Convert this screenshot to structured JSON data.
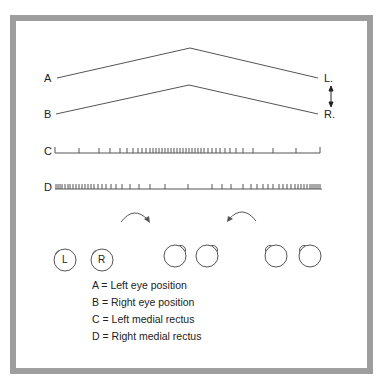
{
  "diagram": {
    "traces": {
      "A": {
        "label": "A",
        "end_label": "L."
      },
      "B": {
        "label": "B",
        "end_label": "R."
      },
      "C": {
        "label": "C"
      },
      "D": {
        "label": "D"
      }
    },
    "eyes": [
      {
        "label": "L"
      },
      {
        "label": "R"
      }
    ],
    "legend": [
      "A = Left eye position",
      "B = Right eye position",
      "C = Left medial rectus",
      "D = Right medial rectus"
    ],
    "colors": {
      "frame": "#9e9e9e",
      "line": "#555555",
      "text": "#222222"
    }
  }
}
